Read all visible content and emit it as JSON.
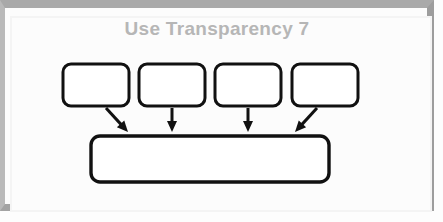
{
  "slide": {
    "title": "Use Transparency 7",
    "title_color": "#b6b6b6",
    "background_color": "#fcfcfc",
    "frame_color": "#a9a9a9",
    "page_color": "#ffffff"
  },
  "diagram": {
    "type": "convergence-flow",
    "stroke_color": "#111111",
    "fill_color": "#ffffff",
    "top_boxes": [
      {
        "id": "box-1",
        "label": "",
        "x": 56,
        "y": 54,
        "width": 66,
        "height": 42,
        "rx": 8
      },
      {
        "id": "box-2",
        "label": "",
        "x": 132,
        "y": 54,
        "width": 66,
        "height": 42,
        "rx": 8
      },
      {
        "id": "box-3",
        "label": "",
        "x": 208,
        "y": 54,
        "width": 66,
        "height": 42,
        "rx": 8
      },
      {
        "id": "box-4",
        "label": "",
        "x": 285,
        "y": 54,
        "width": 66,
        "height": 42,
        "rx": 8
      }
    ],
    "bottom_box": {
      "id": "box-result",
      "label": "",
      "x": 84,
      "y": 126,
      "width": 238,
      "height": 46,
      "rx": 9
    },
    "arrows": [
      {
        "id": "arrow-1",
        "from": "box-1",
        "to": "box-result",
        "direction": "down-right",
        "x1": 99,
        "y1": 98,
        "x2": 121,
        "y2": 122
      },
      {
        "id": "arrow-2",
        "from": "box-2",
        "to": "box-result",
        "direction": "down",
        "x1": 165,
        "y1": 98,
        "x2": 165,
        "y2": 122
      },
      {
        "id": "arrow-3",
        "from": "box-3",
        "to": "box-result",
        "direction": "down",
        "x1": 241,
        "y1": 98,
        "x2": 241,
        "y2": 122
      },
      {
        "id": "arrow-4",
        "from": "box-4",
        "to": "box-result",
        "direction": "down-left",
        "x1": 310,
        "y1": 98,
        "x2": 288,
        "y2": 122
      }
    ]
  }
}
